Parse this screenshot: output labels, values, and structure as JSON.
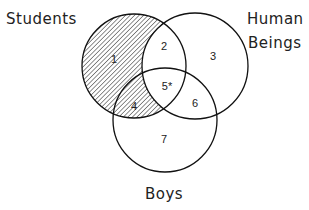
{
  "sets": {
    "students": {
      "label": "Students",
      "cx": 134,
      "cy": 66,
      "r": 52
    },
    "human_beings": {
      "label_line1": "Human",
      "label_line2": "Beings",
      "cx": 195,
      "cy": 66,
      "r": 53
    },
    "boys": {
      "label": "Boys",
      "cx": 165,
      "cy": 120,
      "r": 52
    }
  },
  "regions": [
    {
      "id": "1",
      "label": "1",
      "x": 114,
      "y": 60
    },
    {
      "id": "2",
      "label": "2",
      "x": 164,
      "y": 47
    },
    {
      "id": "3",
      "label": "3",
      "x": 213,
      "y": 57
    },
    {
      "id": "4",
      "label": "4",
      "x": 134,
      "y": 107
    },
    {
      "id": "5",
      "label": "5*",
      "x": 166,
      "y": 87
    },
    {
      "id": "6",
      "label": "6",
      "x": 195,
      "y": 104
    },
    {
      "id": "7",
      "label": "7",
      "x": 164,
      "y": 140
    }
  ],
  "shaded_region": "Students minus Human Beings (regions 1 and 4)",
  "colors": {
    "stroke": "#111111",
    "hatch": "#333333",
    "background": "#ffffff"
  }
}
